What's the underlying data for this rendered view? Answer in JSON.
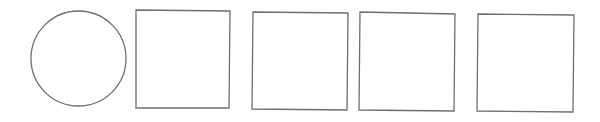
{
  "diagram": {
    "background": "#ffffff",
    "stroke_color": "#6e6e6e",
    "stroke_width": 1.3,
    "shapes": [
      {
        "type": "circle",
        "label": "circle",
        "cx": 78.5,
        "cy": 58.5,
        "r": 47.5
      },
      {
        "type": "quad",
        "label": "square-1",
        "points": "136,10 230,11 229,108 136,108"
      },
      {
        "type": "quad",
        "label": "square-2",
        "points": "253,12 348,13 347,110 252,109"
      },
      {
        "type": "quad",
        "label": "square-3",
        "points": "360,12 455,14 454,111 359,110"
      },
      {
        "type": "quad",
        "label": "square-4",
        "points": "478,14 574,15 573,112 477,111"
      }
    ]
  }
}
